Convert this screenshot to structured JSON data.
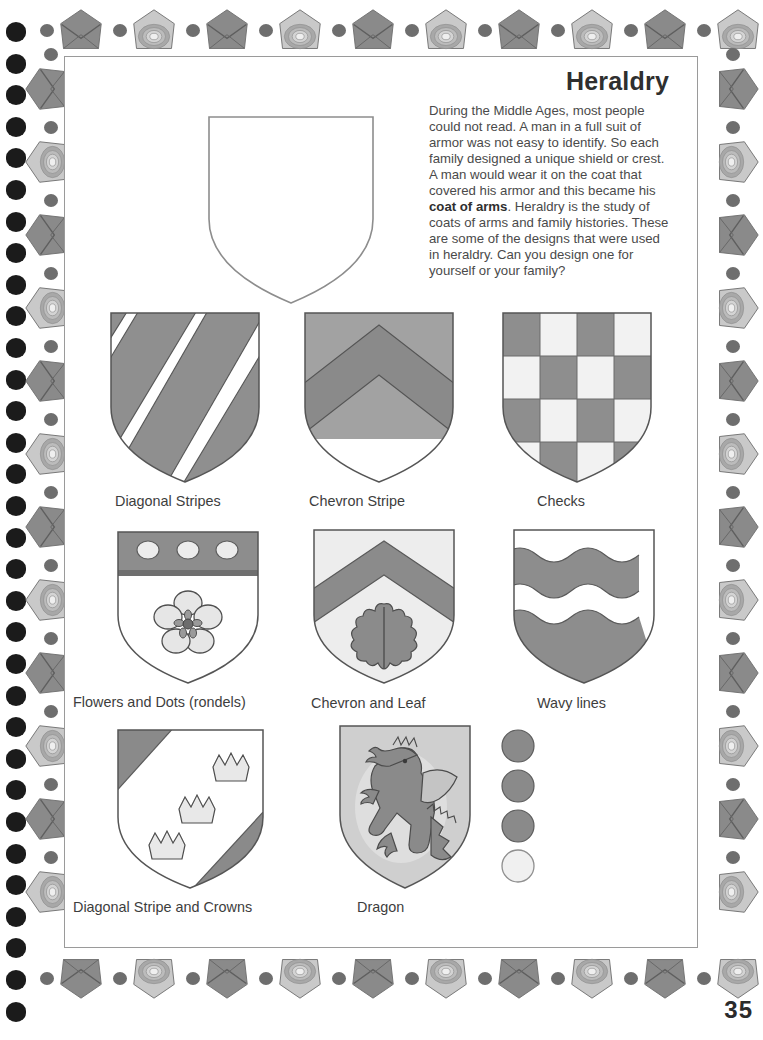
{
  "page": {
    "number": "35",
    "title": "Heraldry",
    "intro_text": "During the Middle Ages, most people could not read. A man in a full suit of armor was not easy to identify. So each family designed a unique shield or crest. A man would wear it on the coat that covered his armor and this became his ",
    "intro_bold": "coat of arms",
    "intro_text_2": ". Heraldry is the study of coats of arms and family histories. These are some of the designs that were used in heraldry. Can you design one for yourself or your family?"
  },
  "shields": [
    {
      "id": "diagonal-stripes",
      "caption": "Diagonal Stripes"
    },
    {
      "id": "chevron-stripe",
      "caption": "Chevron Stripe"
    },
    {
      "id": "checks",
      "caption": "Checks"
    },
    {
      "id": "flowers-and-dots",
      "caption": "Flowers and Dots (rondels)"
    },
    {
      "id": "chevron-and-leaf",
      "caption": "Chevron and Leaf"
    },
    {
      "id": "wavy-lines",
      "caption": "Wavy lines"
    },
    {
      "id": "diagonal-stripe-and-crowns",
      "caption": "Diagonal Stripe and Crowns"
    },
    {
      "id": "dragon",
      "caption": "Dragon"
    }
  ],
  "rondels": [
    {
      "id": "rondel-1",
      "fill": "dark"
    },
    {
      "id": "rondel-2",
      "fill": "dark"
    },
    {
      "id": "rondel-3",
      "fill": "dark"
    },
    {
      "id": "rondel-4",
      "fill": "light"
    }
  ],
  "blank_shield": {
    "id": "blank-shield-template"
  },
  "colors": {
    "page_background": "#ffffff",
    "ink": "#3b3b3b",
    "pencil_dark": "#7d7d7d",
    "pencil_mid": "#9a9a9a",
    "pencil_light": "#d8d8d8",
    "border_gem_dark": "#8a8a8a",
    "border_gem_light": "#c9c9c9",
    "bead": "#6e6e6e",
    "hole": "#1b1b1b"
  }
}
